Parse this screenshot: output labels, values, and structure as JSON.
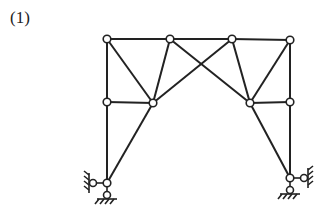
{
  "figure": {
    "label": "(1)",
    "line_color": "#222222",
    "node_fill": "#ffffff"
  },
  "nodes": [
    {
      "id": "A",
      "x": 107,
      "y": 39
    },
    {
      "id": "B",
      "x": 170,
      "y": 39
    },
    {
      "id": "C",
      "x": 232,
      "y": 39
    },
    {
      "id": "D",
      "x": 290,
      "y": 40
    },
    {
      "id": "E",
      "x": 107,
      "y": 102
    },
    {
      "id": "F",
      "x": 153,
      "y": 103
    },
    {
      "id": "G",
      "x": 250,
      "y": 103
    },
    {
      "id": "H",
      "x": 290,
      "y": 102
    },
    {
      "id": "I",
      "x": 107,
      "y": 183
    },
    {
      "id": "J",
      "x": 290,
      "y": 178
    }
  ],
  "members": [
    [
      "A",
      "B"
    ],
    [
      "B",
      "C"
    ],
    [
      "C",
      "D"
    ],
    [
      "A",
      "E"
    ],
    [
      "E",
      "I"
    ],
    [
      "E",
      "F"
    ],
    [
      "A",
      "F"
    ],
    [
      "B",
      "F"
    ],
    [
      "F",
      "I"
    ],
    [
      "B",
      "G"
    ],
    [
      "C",
      "F"
    ],
    [
      "C",
      "G"
    ],
    [
      "D",
      "G"
    ],
    [
      "G",
      "H"
    ],
    [
      "D",
      "H"
    ],
    [
      "H",
      "J"
    ],
    [
      "G",
      "J"
    ]
  ],
  "supports": [
    {
      "node": "I",
      "types": [
        "hinge-left",
        "hinge-bottom"
      ]
    },
    {
      "node": "J",
      "types": [
        "hinge-right",
        "hinge-bottom"
      ]
    }
  ]
}
